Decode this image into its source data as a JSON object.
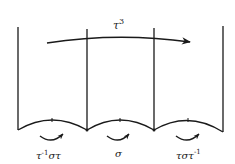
{
  "diagram": {
    "top_arrow": {
      "label_base": "τ",
      "label_sup": "3"
    },
    "twists": [
      {
        "label": "τ⁻¹στ",
        "base1": "τ",
        "sup1": "-1",
        "rest": "στ"
      },
      {
        "label": "σ"
      },
      {
        "label": "τστ⁻¹",
        "base": "τστ",
        "sup": "-1"
      }
    ],
    "ink_color": "#1a1a1a",
    "background_color": "#ffffff"
  }
}
